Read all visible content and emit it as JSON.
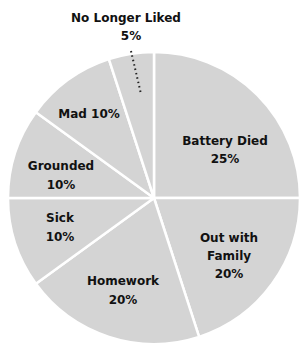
{
  "chart_data": {
    "type": "pie",
    "title": "",
    "start_angle_deg": 0,
    "direction": "clockwise",
    "slices": [
      {
        "label": "Battery Died",
        "value": 25,
        "display": "25%"
      },
      {
        "label": "Out with Family",
        "value": 20,
        "display": "20%"
      },
      {
        "label": "Homework",
        "value": 20,
        "display": "20%"
      },
      {
        "label": "Sick",
        "value": 10,
        "display": "10%"
      },
      {
        "label": "Grounded",
        "value": 10,
        "display": "10%"
      },
      {
        "label": "Mad",
        "value": 10,
        "display": "10%"
      },
      {
        "label": "No Longer Liked",
        "value": 5,
        "display": "5%"
      }
    ],
    "categories": [
      "Battery Died",
      "Out with Family",
      "Homework",
      "Sick",
      "Grounded",
      "Mad",
      "No Longer Liked"
    ],
    "values": [
      25,
      20,
      20,
      10,
      10,
      10,
      5
    ],
    "colors": {
      "slice_fill": "#d4d4d4",
      "divider": "#ffffff",
      "label": "#111111",
      "leader_line": "#222222"
    },
    "legend": "none (direct labels)"
  },
  "labels": {
    "battery_died": {
      "line1": "Battery Died",
      "line2": "25%"
    },
    "out_with_family": {
      "line1": "Out with",
      "line2": "Family",
      "line3": "20%"
    },
    "homework": {
      "line1": "Homework",
      "line2": "20%"
    },
    "sick": {
      "line1": "Sick",
      "line2": "10%"
    },
    "grounded": {
      "line1": "Grounded",
      "line2": "10%"
    },
    "mad": {
      "line1": "Mad 10%"
    },
    "no_longer_liked": {
      "line1": "No Longer Liked",
      "line2": "5%"
    }
  }
}
